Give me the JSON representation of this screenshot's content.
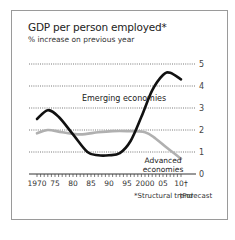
{
  "chart_data": {
    "type": "line",
    "title": "GDP per person employed*",
    "subtitle": "% increase on previous year",
    "xlabel": "",
    "ylabel": "",
    "x_tick_labels": [
      "1970",
      "75",
      "80",
      "85",
      "90",
      "95",
      "2000",
      "05",
      "10†"
    ],
    "x_ticks": [
      1970,
      1975,
      1980,
      1985,
      1990,
      1995,
      2000,
      2005,
      2010
    ],
    "y_ticks": [
      0,
      1,
      2,
      3,
      4,
      5
    ],
    "ylim": [
      0,
      5
    ],
    "xlim": [
      1970,
      2010
    ],
    "grid": "horizontal dotted",
    "legend": "inline labels",
    "series": [
      {
        "name": "Emerging economies",
        "color": "#111111",
        "x": [
          1970,
          1973,
          1976,
          1980,
          1984,
          1987,
          1990,
          1993,
          1996,
          1999,
          2002,
          2005,
          2007,
          2010
        ],
        "values": [
          2.5,
          2.9,
          2.6,
          1.8,
          1.0,
          0.85,
          0.85,
          0.95,
          1.5,
          2.6,
          3.8,
          4.5,
          4.6,
          4.3
        ]
      },
      {
        "name": "Advanced economies",
        "color": "#b0b0b0",
        "x": [
          1970,
          1973,
          1977,
          1982,
          1987,
          1991,
          1995,
          2000,
          2003,
          2006,
          2010
        ],
        "values": [
          1.85,
          2.0,
          1.9,
          1.8,
          1.9,
          1.95,
          1.95,
          1.9,
          1.6,
          1.2,
          0.7
        ]
      }
    ],
    "annotations": [
      "Emerging economies",
      "Advanced economies"
    ],
    "footnotes": [
      "*Structural trend",
      "†Forecast"
    ]
  },
  "labels": {
    "emerging": "Emerging economies",
    "advanced_line1": "Advanced",
    "advanced_line2": "economies",
    "footnote_structural": "*Structural trend",
    "footnote_forecast": "†Forecast"
  }
}
